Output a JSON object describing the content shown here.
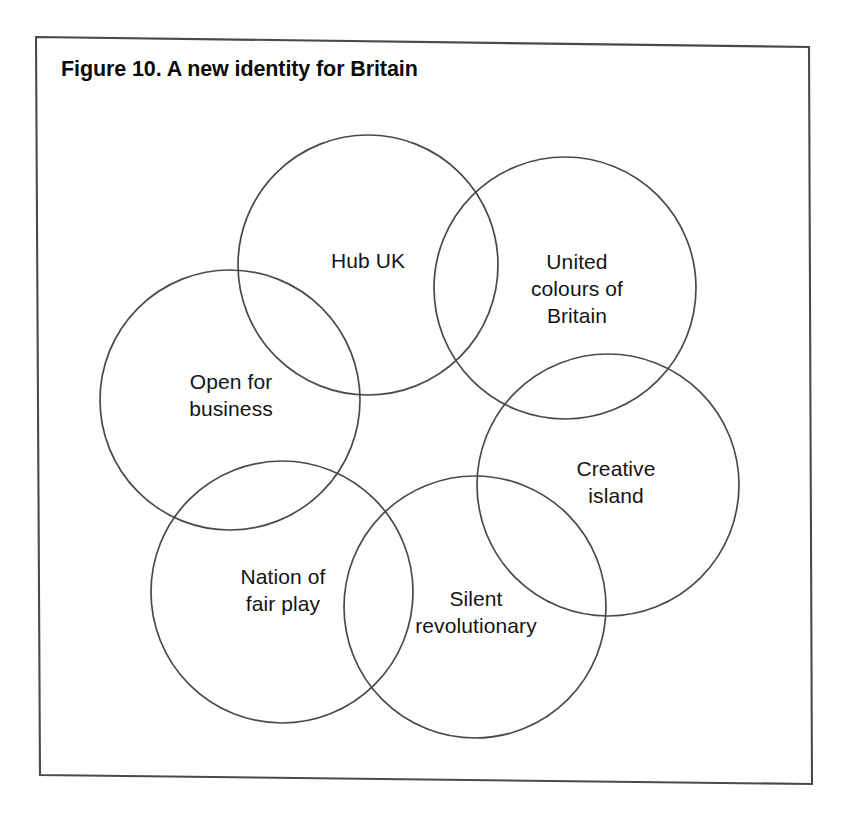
{
  "figure": {
    "title": "Figure 10. A new identity for Britain",
    "frame": {
      "stroke_color": "#4a4a4a",
      "fill_color": "#ffffff"
    }
  },
  "diagram": {
    "type": "venn",
    "circle_stroke_color": "#4a4a4a",
    "circle_fill": "none",
    "circles": [
      {
        "id": "hub-uk",
        "label": "Hub UK",
        "cx": 368,
        "cy": 265,
        "r": 130,
        "label_x": 368,
        "label_y": 260
      },
      {
        "id": "united-colours-of-britain",
        "label": "United\ncolours of\nBritain",
        "cx": 565,
        "cy": 288,
        "r": 131,
        "label_x": 577,
        "label_y": 288
      },
      {
        "id": "open-for-business",
        "label": "Open for\nbusiness",
        "cx": 230,
        "cy": 400,
        "r": 130,
        "label_x": 231,
        "label_y": 395
      },
      {
        "id": "creative-island",
        "label": "Creative\nisland",
        "cx": 608,
        "cy": 485,
        "r": 131,
        "label_x": 616,
        "label_y": 482
      },
      {
        "id": "nation-of-fair-play",
        "label": "Nation of\nfair play",
        "cx": 282,
        "cy": 592,
        "r": 131,
        "label_x": 283,
        "label_y": 590
      },
      {
        "id": "silent-revolutionary",
        "label": "Silent\nrevolutionary",
        "cx": 475,
        "cy": 607,
        "r": 131,
        "label_x": 476,
        "label_y": 612
      }
    ]
  }
}
